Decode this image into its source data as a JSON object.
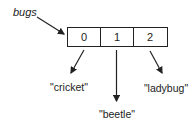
{
  "diagram": {
    "variable": {
      "name": "bugs"
    },
    "array": {
      "indices": [
        "0",
        "1",
        "2"
      ]
    },
    "elements": [
      {
        "index": "0",
        "value": "\"cricket\""
      },
      {
        "index": "1",
        "value": "\"beetle\""
      },
      {
        "index": "2",
        "value": "\"ladybug\""
      }
    ],
    "colors": {
      "line": "#222222",
      "text": "#222222",
      "background": "#ffffff"
    }
  }
}
